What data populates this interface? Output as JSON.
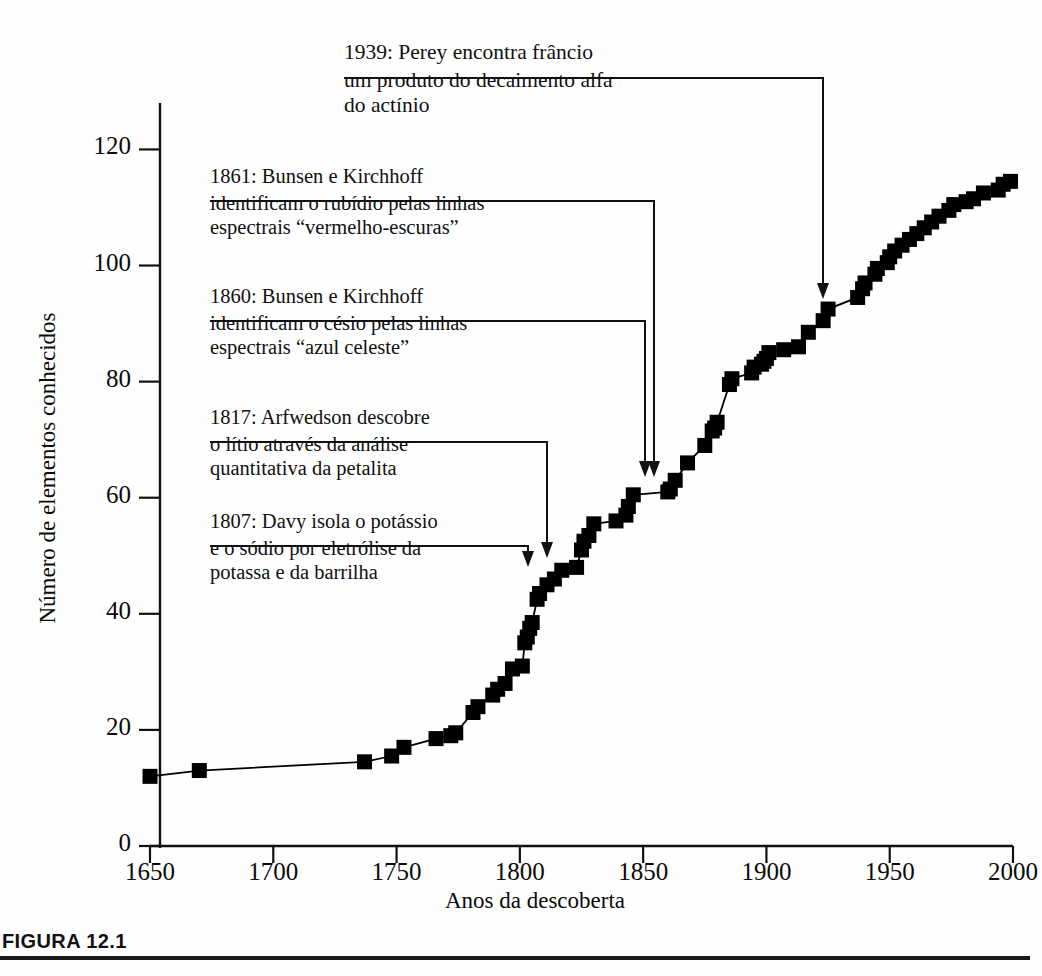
{
  "figure": {
    "caption_label": "FIGURA 12.1",
    "rule_color": "#1a1a1a"
  },
  "chart_data": {
    "type": "line",
    "title": "",
    "subtitle": "",
    "xlabel": "Anos da descoberta",
    "ylabel": "Número de elementos conhecidos",
    "xlim": [
      1650,
      2000
    ],
    "ylim": [
      0,
      128
    ],
    "xticks": [
      1650,
      1700,
      1750,
      1800,
      1850,
      1900,
      1950,
      2000
    ],
    "xtick_labels": [
      "1650",
      "1700",
      "1750",
      "1800",
      "1850",
      "1900",
      "1950",
      "2000"
    ],
    "yticks": [
      0,
      20,
      40,
      60,
      80,
      100,
      120
    ],
    "ytick_labels": [
      "0",
      "20",
      "40",
      "60",
      "80",
      "100",
      "120"
    ],
    "grid": false,
    "legend": false,
    "marker": "square",
    "marker_color": "#000000",
    "line_color": "#000000",
    "series": [
      {
        "name": "Elementos conhecidos",
        "x": [
          1650,
          1670,
          1737,
          1748,
          1753,
          1766,
          1772,
          1774,
          1781,
          1783,
          1789,
          1791,
          1794,
          1797,
          1801,
          1802,
          1803,
          1804,
          1805,
          1807,
          1808,
          1811,
          1814,
          1817,
          1823,
          1825,
          1826,
          1828,
          1830,
          1839,
          1843,
          1844,
          1846,
          1860,
          1861,
          1863,
          1868,
          1875,
          1878,
          1879,
          1880,
          1885,
          1886,
          1894,
          1895,
          1898,
          1899,
          1900,
          1901,
          1907,
          1913,
          1917,
          1923,
          1925,
          1937,
          1939,
          1940,
          1944,
          1945,
          1949,
          1950,
          1952,
          1955,
          1958,
          1961,
          1964,
          1967,
          1970,
          1974,
          1976,
          1981,
          1984,
          1988,
          1994,
          1996,
          1999
        ],
        "y": [
          12,
          13,
          14.5,
          15.5,
          17,
          18.5,
          19,
          19.5,
          23,
          24,
          26,
          27,
          28,
          30.5,
          31,
          35,
          36,
          37.5,
          38.5,
          42.5,
          43.5,
          45,
          46,
          47.5,
          48,
          51,
          52.5,
          53.5,
          55.5,
          56,
          57,
          58.5,
          60.5,
          61,
          61.5,
          63,
          66,
          69,
          71.5,
          72,
          73,
          79.5,
          80.5,
          81.5,
          82.5,
          83,
          83.5,
          84,
          85,
          85.5,
          86,
          88.5,
          90.5,
          92.5,
          94.5,
          96,
          97,
          98.5,
          99.5,
          100.5,
          101.5,
          102.5,
          103.5,
          104.5,
          105.5,
          106.5,
          107.5,
          108.5,
          109.5,
          110.5,
          111,
          111.5,
          112.5,
          113,
          114,
          114.5
        ]
      }
    ],
    "annotations": [
      {
        "id": "1939",
        "year": 1939,
        "head": "1939: Perey encontra frâncio",
        "body": [
          "um produto do decaimento alfa",
          "do actínio"
        ],
        "target_value": 96
      },
      {
        "id": "1861",
        "year": 1861,
        "head": "1861: Bunsen e Kirchhoff",
        "body": [
          "identificam o rubídio pelas linhas",
          "espectrais “vermelho-escuras”"
        ],
        "target_value": 61.5
      },
      {
        "id": "1860",
        "year": 1860,
        "head": "1860: Bunsen e Kirchhoff",
        "body": [
          "identificam o césio pelas linhas",
          "espectrais “azul celeste”"
        ],
        "target_value": 61
      },
      {
        "id": "1817",
        "year": 1817,
        "head": "1817: Arfwedson descobre",
        "body": [
          "o lítio através da análise",
          "quantitativa da petalita"
        ],
        "target_value": 47.5
      },
      {
        "id": "1807",
        "year": 1807,
        "head": "1807: Davy isola o potássio",
        "body": [
          "e o sódio por eletrólise da",
          "potassa e da barrilha"
        ],
        "target_value": 42.5
      }
    ]
  }
}
